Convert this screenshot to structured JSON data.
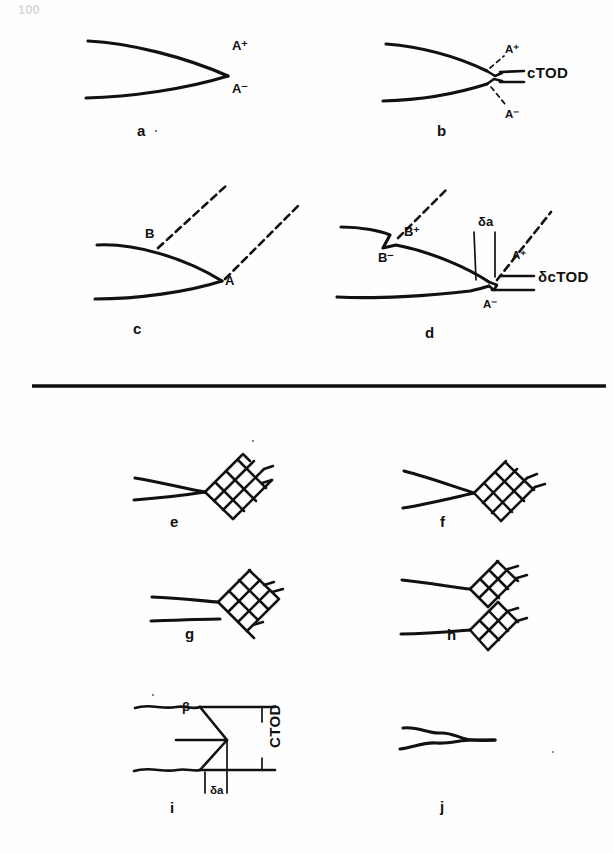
{
  "page": {
    "page_number_faint": "100",
    "background_color": "#fefefe",
    "ink_color": "#111111"
  },
  "divider": {
    "name": "horizontal-rule",
    "x1": 32,
    "x2": 606,
    "y": 386
  },
  "panels": [
    {
      "id": "a",
      "label": "a",
      "label_x": 137,
      "label_y": 136,
      "description": "Sharp closed crack tip, pointed, with upper and lower flank labels",
      "annotations": [
        {
          "text": "A⁺",
          "x": 232,
          "y": 50,
          "style": "tag"
        },
        {
          "text": "A⁻",
          "x": 232,
          "y": 93,
          "style": "tag"
        }
      ]
    },
    {
      "id": "b",
      "label": "b",
      "label_x": 437,
      "label_y": 136,
      "description": "Blunted crack tip with crack tip opening displacement bracket",
      "annotations": [
        {
          "text": "A⁺",
          "x": 505,
          "y": 53,
          "style": "tag-sm"
        },
        {
          "text": "cTOD",
          "x": 527,
          "y": 78,
          "style": "tag-big"
        },
        {
          "text": "A⁻",
          "x": 505,
          "y": 118,
          "style": "tag-sm"
        }
      ]
    },
    {
      "id": "c",
      "label": "c",
      "label_x": 133,
      "label_y": 334,
      "description": "Sharp crack with two dashed slip bands emanating from points A and B",
      "annotations": [
        {
          "text": "B",
          "x": 145,
          "y": 238,
          "style": "tag"
        },
        {
          "text": "A",
          "x": 225,
          "y": 285,
          "style": "tag"
        }
      ]
    },
    {
      "id": "d",
      "label": "d",
      "label_x": 425,
      "label_y": 338,
      "description": "Extended blunted crack with step, crack growth increment and CTOD increment",
      "annotations": [
        {
          "text": "B⁺",
          "x": 404,
          "y": 236,
          "style": "tag"
        },
        {
          "text": "B⁻",
          "x": 378,
          "y": 262,
          "style": "tag"
        },
        {
          "text": "δa",
          "x": 478,
          "y": 226,
          "style": "tag"
        },
        {
          "text": "A⁺",
          "x": 512,
          "y": 259,
          "style": "tag-sm"
        },
        {
          "text": "δcTOD",
          "x": 538,
          "y": 282,
          "style": "tag-big"
        },
        {
          "text": "A⁻",
          "x": 483,
          "y": 308,
          "style": "tag-sm"
        }
      ]
    },
    {
      "id": "e",
      "label": "e",
      "label_x": 170,
      "label_y": 527,
      "description": "Sharp crack tip meeting a single diamond cross-hatched slip/plastic zone",
      "annotations": []
    },
    {
      "id": "f",
      "label": "f",
      "label_x": 440,
      "label_y": 527,
      "description": "Slightly opened crack tip with diamond cross-hatched plastic zone",
      "annotations": []
    },
    {
      "id": "g",
      "label": "g",
      "label_x": 185,
      "label_y": 639,
      "description": "Parallel opened crack flanks terminating at a diamond mesh plastic zone",
      "annotations": []
    },
    {
      "id": "h",
      "label": "h",
      "label_x": 447,
      "label_y": 640,
      "description": "Widely opened crack with two separated diamond mesh plastic zones",
      "annotations": []
    },
    {
      "id": "i",
      "label": "i",
      "label_x": 170,
      "label_y": 813,
      "description": "Wedge shaped crack tip geometry showing angle beta, CTOD and crack advance",
      "annotations": [
        {
          "text": "β",
          "x": 192,
          "y": 711,
          "style": "tag"
        },
        {
          "text": "CTOD",
          "x": 280,
          "y": 748,
          "style": "tag-big",
          "rotated": true
        },
        {
          "text": "δa",
          "x": 222,
          "y": 794,
          "style": "tag-sm"
        }
      ]
    },
    {
      "id": "j",
      "label": "j",
      "label_x": 440,
      "label_y": 812,
      "description": "Irregular jagged closed crack, rough fracture surface",
      "annotations": []
    }
  ]
}
